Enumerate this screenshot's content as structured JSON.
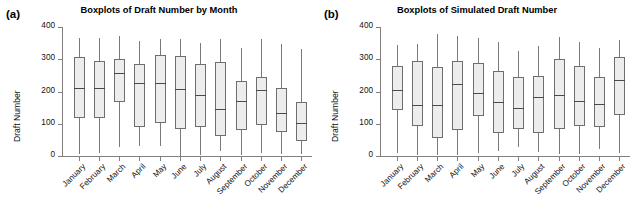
{
  "figure": {
    "width": 637,
    "height": 223,
    "background": "#ffffff",
    "box_fill": "#ededed",
    "box_stroke": "#6e6e6e",
    "axis_color": "#808080"
  },
  "panels": [
    {
      "label": "(a)",
      "title": "Boxplots of Draft Number by Month",
      "ylabel": "Draft Number"
    },
    {
      "label": "(b)",
      "title": "Boxplots of Simulated Draft Number",
      "ylabel": "Draft Number"
    }
  ],
  "chart_data": [
    {
      "type": "boxplot",
      "panel": "(a)",
      "title": "Boxplots of Draft Number by Month",
      "xlabel": "",
      "ylabel": "Draft Number",
      "ylim": [
        0,
        400
      ],
      "yticks": [
        0,
        100,
        200,
        300,
        400
      ],
      "grid": false,
      "legend": "none",
      "categories": [
        "January",
        "February",
        "March",
        "April",
        "May",
        "June",
        "July",
        "August",
        "September",
        "October",
        "November",
        "December"
      ],
      "boxes": [
        {
          "category": "January",
          "whisker_low": 5,
          "q1": 119,
          "median": 212,
          "q3": 306,
          "whisker_high": 366
        },
        {
          "category": "February",
          "whisker_low": 8,
          "q1": 119,
          "median": 210,
          "q3": 295,
          "whisker_high": 365
        },
        {
          "category": "March",
          "whisker_low": 29,
          "q1": 166,
          "median": 256,
          "q3": 300,
          "whisker_high": 371
        },
        {
          "category": "April",
          "whisker_low": 31,
          "q1": 90,
          "median": 225,
          "q3": 284,
          "whisker_high": 356
        },
        {
          "category": "May",
          "whisker_low": 30,
          "q1": 103,
          "median": 226,
          "q3": 313,
          "whisker_high": 364
        },
        {
          "category": "June",
          "whisker_low": 1,
          "q1": 83,
          "median": 208,
          "q3": 311,
          "whisker_high": 362
        },
        {
          "category": "July",
          "whisker_low": 2,
          "q1": 89,
          "median": 189,
          "q3": 284,
          "whisker_high": 350
        },
        {
          "category": "August",
          "whisker_low": 14,
          "q1": 63,
          "median": 147,
          "q3": 291,
          "whisker_high": 362
        },
        {
          "category": "September",
          "whisker_low": 3,
          "q1": 82,
          "median": 170,
          "q3": 233,
          "whisker_high": 334
        },
        {
          "category": "October",
          "whisker_low": 8,
          "q1": 96,
          "median": 204,
          "q3": 245,
          "whisker_high": 364
        },
        {
          "category": "November",
          "whisker_low": 6,
          "q1": 73,
          "median": 134,
          "q3": 211,
          "whisker_high": 348
        },
        {
          "category": "December",
          "whisker_low": 7,
          "q1": 45,
          "median": 101,
          "q3": 166,
          "whisker_high": 331
        }
      ]
    },
    {
      "type": "boxplot",
      "panel": "(b)",
      "title": "Boxplots of Simulated Draft Number",
      "xlabel": "",
      "ylabel": "Draft Number",
      "ylim": [
        0,
        400
      ],
      "yticks": [
        0,
        100,
        200,
        300,
        400
      ],
      "grid": false,
      "legend": "none",
      "categories": [
        "January",
        "February",
        "March",
        "April",
        "May",
        "June",
        "July",
        "August",
        "September",
        "October",
        "November",
        "December"
      ],
      "boxes": [
        {
          "category": "January",
          "whisker_low": 10,
          "q1": 143,
          "median": 205,
          "q3": 278,
          "whisker_high": 345
        },
        {
          "category": "February",
          "whisker_low": 2,
          "q1": 93,
          "median": 157,
          "q3": 295,
          "whisker_high": 348
        },
        {
          "category": "March",
          "whisker_low": 3,
          "q1": 55,
          "median": 157,
          "q3": 275,
          "whisker_high": 378
        },
        {
          "category": "April",
          "whisker_low": 4,
          "q1": 82,
          "median": 224,
          "q3": 295,
          "whisker_high": 372
        },
        {
          "category": "May",
          "whisker_low": 8,
          "q1": 123,
          "median": 195,
          "q3": 288,
          "whisker_high": 366
        },
        {
          "category": "June",
          "whisker_low": 15,
          "q1": 72,
          "median": 168,
          "q3": 263,
          "whisker_high": 355
        },
        {
          "category": "July",
          "whisker_low": 27,
          "q1": 83,
          "median": 148,
          "q3": 245,
          "whisker_high": 325
        },
        {
          "category": "August",
          "whisker_low": 11,
          "q1": 71,
          "median": 182,
          "q3": 249,
          "whisker_high": 342
        },
        {
          "category": "September",
          "whisker_low": 5,
          "q1": 83,
          "median": 188,
          "q3": 302,
          "whisker_high": 368
        },
        {
          "category": "October",
          "whisker_low": 6,
          "q1": 94,
          "median": 170,
          "q3": 278,
          "whisker_high": 352
        },
        {
          "category": "November",
          "whisker_low": 21,
          "q1": 90,
          "median": 162,
          "q3": 245,
          "whisker_high": 334
        },
        {
          "category": "December",
          "whisker_low": 9,
          "q1": 127,
          "median": 236,
          "q3": 306,
          "whisker_high": 360
        }
      ]
    }
  ]
}
